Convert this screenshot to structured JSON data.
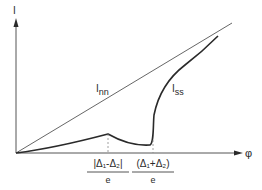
{
  "diagram": {
    "axes": {
      "y_label": "I",
      "x_label": "φ"
    },
    "curves": [
      {
        "name": "I",
        "subscript": "nn",
        "description": "straight line through origin"
      },
      {
        "name": "I",
        "subscript": "ss",
        "description": "peak then dip then sharp rise"
      }
    ],
    "x_markers": [
      {
        "numerator": "|Δ₁-Δ₂|",
        "denominator": "e"
      },
      {
        "numerator": "(Δ₁+Δ₂)",
        "denominator": "e"
      }
    ],
    "colors": {
      "line": "#2a2a2a",
      "thin_line": "#555555",
      "dashed": "#888888"
    }
  }
}
